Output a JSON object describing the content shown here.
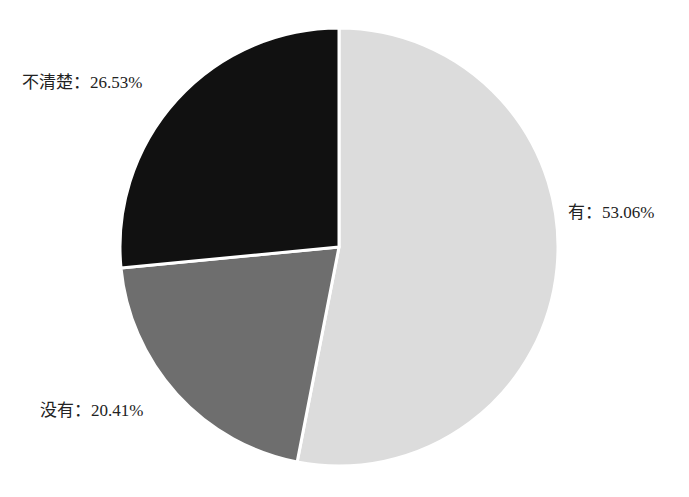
{
  "chart_data": {
    "type": "pie",
    "title": "",
    "start_angle_deg": 0,
    "direction": "clockwise",
    "slices": [
      {
        "name": "有",
        "value": 53.06,
        "label": "有：53.06%",
        "color": "#dcdcdc"
      },
      {
        "name": "没有",
        "value": 20.41,
        "label": "没有：20.41%",
        "color": "#6e6e6e"
      },
      {
        "name": "不清楚",
        "value": 26.53,
        "label": "不清楚：26.53%",
        "color": "#111111"
      }
    ],
    "legend": "none",
    "separator_color": "#ffffff"
  },
  "labels": {
    "yes": "有：53.06%",
    "no": "没有：20.41%",
    "unclear": "不清楚：26.53%"
  }
}
